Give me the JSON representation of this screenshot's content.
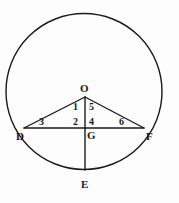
{
  "figure": {
    "name": "circle-with-inscribed-triangle-and-chord",
    "background_color": "#fdfdfd",
    "stroke_color": "#1a1a1a",
    "label_color": "#1a1a1a"
  },
  "points": [
    {
      "id": "O",
      "label": "O",
      "x": 85,
      "y": 97,
      "label_x": 82,
      "label_y": 83,
      "role": "center-apex"
    },
    {
      "id": "D",
      "label": "D",
      "x": 24,
      "y": 128,
      "label_x": 19,
      "label_y": 132,
      "role": "chord-left-end"
    },
    {
      "id": "F",
      "label": "F",
      "x": 144,
      "y": 128,
      "label_x": 146,
      "label_y": 132,
      "role": "chord-right-end"
    },
    {
      "id": "G",
      "label": "G",
      "x": 85,
      "y": 128,
      "label_x": 87,
      "label_y": 132,
      "role": "intersection"
    },
    {
      "id": "E",
      "label": "E",
      "x": 85,
      "y": 170,
      "label_x": 82,
      "label_y": 177,
      "role": "arc-bottom"
    }
  ],
  "angle_labels": [
    {
      "id": "a1",
      "label": "1",
      "x": 75,
      "y": 103
    },
    {
      "id": "a5",
      "label": "5",
      "x": 89,
      "y": 103
    },
    {
      "id": "a2",
      "label": "2",
      "x": 75,
      "y": 118
    },
    {
      "id": "a4",
      "label": "4",
      "x": 89,
      "y": 118
    },
    {
      "id": "a3",
      "label": "3",
      "x": 40,
      "y": 118
    },
    {
      "id": "a6",
      "label": "6",
      "x": 120,
      "y": 118
    }
  ],
  "circle": {
    "center_x": 84,
    "center_y": 91.5,
    "radius": 78,
    "stroke_width": 1.4
  },
  "segments": [
    {
      "id": "seg-DF",
      "name": "chord-d-f",
      "x1": 24,
      "y1": 128,
      "x2": 144,
      "y2": 128
    },
    {
      "id": "seg-OD",
      "name": "radius-o-d",
      "x1": 85,
      "y1": 97,
      "x2": 24,
      "y2": 128
    },
    {
      "id": "seg-OF",
      "name": "radius-o-f",
      "x1": 85,
      "y1": 97,
      "x2": 144,
      "y2": 128
    },
    {
      "id": "seg-OE",
      "name": "vertical-o-to-e",
      "x1": 85,
      "y1": 97,
      "x2": 85,
      "y2": 170
    }
  ]
}
